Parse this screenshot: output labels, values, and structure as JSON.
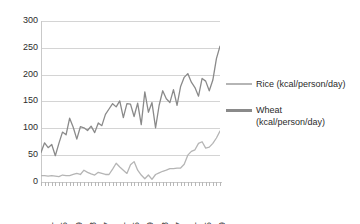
{
  "chart_data": {
    "type": "line",
    "title": "",
    "xlabel": "",
    "ylabel": "",
    "ylim": [
      0,
      300
    ],
    "yticks": [
      0,
      50,
      100,
      150,
      200,
      250,
      300
    ],
    "grid": true,
    "legend_position": "right",
    "x": [
      1961,
      1962,
      1963,
      1964,
      1965,
      1966,
      1967,
      1968,
      1969,
      1970,
      1971,
      1972,
      1973,
      1974,
      1975,
      1976,
      1977,
      1978,
      1979,
      1980,
      1981,
      1982,
      1983,
      1984,
      1985,
      1986,
      1987,
      1988,
      1989,
      1990,
      1991,
      1992,
      1993,
      1994,
      1995,
      1996,
      1997,
      1998,
      1999,
      2000,
      2001,
      2002,
      2003,
      2004,
      2005,
      2006,
      2007,
      2008,
      2009,
      2010,
      2011
    ],
    "xtick_labels": [
      "1961",
      "1965",
      "1969",
      "1973",
      "1977",
      "1981",
      "1985",
      "1989",
      "1993",
      "1997",
      "2001",
      "2005",
      "2009"
    ],
    "xtick_years": [
      1961,
      1965,
      1969,
      1973,
      1977,
      1981,
      1985,
      1989,
      1993,
      1997,
      2001,
      2005,
      2009
    ],
    "series": [
      {
        "name": "Rice (kcal/person/day)",
        "color": "#b5b5b5",
        "values": [
          12,
          12,
          11,
          12,
          11,
          10,
          13,
          12,
          12,
          14,
          16,
          14,
          22,
          18,
          15,
          13,
          18,
          16,
          14,
          14,
          24,
          35,
          28,
          22,
          16,
          32,
          38,
          22,
          13,
          6,
          13,
          5,
          14,
          17,
          20,
          22,
          25,
          25,
          26,
          26,
          33,
          50,
          57,
          60,
          72,
          75,
          63,
          65,
          72,
          82,
          95
        ]
      },
      {
        "name": "Wheat (kcal/person/day)",
        "color": "#8a8a8a",
        "values": [
          55,
          73,
          64,
          70,
          49,
          72,
          93,
          88,
          119,
          102,
          80,
          103,
          101,
          96,
          104,
          92,
          110,
          105,
          126,
          136,
          146,
          140,
          151,
          120,
          146,
          145,
          122,
          147,
          107,
          168,
          130,
          148,
          101,
          143,
          170,
          155,
          148,
          172,
          143,
          178,
          195,
          202,
          186,
          176,
          160,
          193,
          188,
          170,
          190,
          230,
          253
        ]
      }
    ]
  },
  "legend": {
    "entries": [
      {
        "label_line1": "Rice (kcal/person/day)",
        "label_line2": "",
        "color": "#b5b5b5"
      },
      {
        "label_line1": "Wheat",
        "label_line2": "(kcal/person/day)",
        "color": "#8a8a8a"
      }
    ]
  },
  "axis": {
    "y_labels": [
      "300",
      "250",
      "200",
      "150",
      "100",
      "50",
      "0"
    ]
  }
}
